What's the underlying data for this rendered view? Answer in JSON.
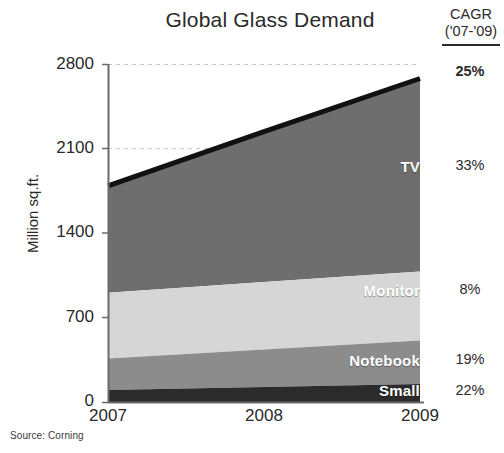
{
  "chart_data": {
    "type": "area",
    "title": "Global Glass Demand",
    "xlabel": "",
    "ylabel": "Million sq.ft.",
    "categories": [
      "2007",
      "2008",
      "2009"
    ],
    "x": [
      2007,
      2008,
      2009
    ],
    "ylim": [
      0,
      2800
    ],
    "yticks": [
      0,
      700,
      1400,
      2100,
      2800
    ],
    "ytick_labels": [
      "0",
      "700",
      "1400",
      "2100",
      "2800"
    ],
    "grid": true,
    "stacked": true,
    "legend_position": "inline-labels",
    "series": [
      {
        "name": "Small",
        "values": [
          100,
          125,
          150
        ],
        "color": "#2b2b2b",
        "cagr": "22%"
      },
      {
        "name": "Notebook",
        "values": [
          260,
          310,
          360
        ],
        "color": "#8c8c8c",
        "cagr": "19%"
      },
      {
        "name": "Monitor",
        "values": [
          545,
          560,
          570
        ],
        "color": "#d6d6d6",
        "cagr": "8%"
      },
      {
        "name": "TV",
        "values": [
          885,
          1245,
          1600
        ],
        "color": "#6e6e6e",
        "cagr": "33%"
      }
    ],
    "totals": [
      1790,
      2240,
      2680
    ],
    "total_cagr": "25%",
    "annotations": {
      "cagr_header_line1": "CAGR",
      "cagr_header_line2": "('07-'09)",
      "source": "Source: Corning"
    }
  },
  "ytick_labels": {
    "t0": "0",
    "t700": "700",
    "t1400": "1400",
    "t2100": "2100",
    "t2800": "2800"
  },
  "xtick_labels": {
    "x2007": "2007",
    "x2008": "2008",
    "x2009": "2009"
  },
  "segment_labels": {
    "tv": "TV",
    "monitor": "Monitor",
    "notebook": "Notebook",
    "small": "Small"
  },
  "cagr_values": {
    "total": "25%",
    "tv": "33%",
    "monitor": "8%",
    "notebook": "19%",
    "small": "22%"
  },
  "colors": {
    "tv": "#6e6e6e",
    "monitor": "#d6d6d6",
    "notebook": "#8c8c8c",
    "small": "#2b2b2b",
    "top_line": "#111111",
    "axis": "#6b6b6b",
    "grid": "#c9c9c9",
    "text": "#2a2a2a"
  }
}
